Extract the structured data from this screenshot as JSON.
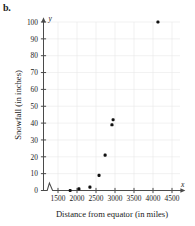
{
  "figure": {
    "part_label": "b."
  },
  "chart_data": {
    "type": "scatter",
    "title": "",
    "xlabel": "Distance from equator (in miles)",
    "ylabel": "Snowfall (in inches)",
    "x_axis_variable": "x",
    "y_axis_variable": "y",
    "xlim": [
      1150,
      4700
    ],
    "ylim": [
      0,
      103
    ],
    "x_ticks": [
      1500,
      2000,
      2500,
      3000,
      3500,
      4000,
      4500
    ],
    "x_tick_labels": [
      "1500",
      "2000",
      "2500",
      "3000",
      "3500",
      "4000",
      "4500"
    ],
    "y_ticks": [
      0,
      10,
      20,
      30,
      40,
      50,
      60,
      70,
      80,
      90,
      100
    ],
    "y_tick_labels": [
      "0",
      "10",
      "20",
      "30",
      "40",
      "50",
      "60",
      "70",
      "80",
      "90",
      "100"
    ],
    "grid": true,
    "grid_color": "#e8e8e8",
    "axis_break": "x-axis zigzag break near origin",
    "legend": null,
    "marker_color": "#111111",
    "points": [
      {
        "x": 1820,
        "y": 0
      },
      {
        "x": 2050,
        "y": 1
      },
      {
        "x": 2340,
        "y": 2
      },
      {
        "x": 2580,
        "y": 9
      },
      {
        "x": 2740,
        "y": 21
      },
      {
        "x": 2920,
        "y": 39
      },
      {
        "x": 2950,
        "y": 42
      },
      {
        "x": 4130,
        "y": 100
      }
    ]
  }
}
